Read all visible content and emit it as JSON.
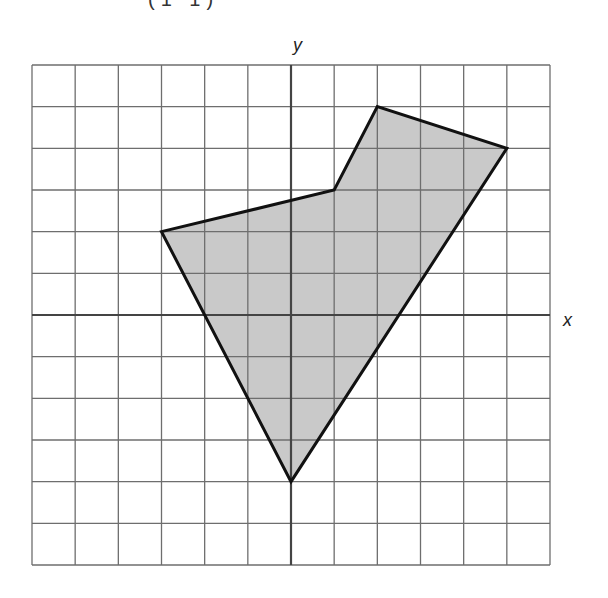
{
  "top_fragment": "(1  1)",
  "axes": {
    "x_label": "x",
    "y_label": "y"
  },
  "grid": {
    "columns": 12,
    "rows": 12,
    "x_min": -6,
    "x_max": 6,
    "y_min": -6,
    "y_max": 6,
    "left_px": 32,
    "top_px": 65,
    "width_px": 518,
    "height_px": 500
  },
  "polygon": {
    "vertices": [
      [
        -3,
        2
      ],
      [
        1,
        3
      ],
      [
        2,
        5
      ],
      [
        5,
        4
      ],
      [
        0,
        -4
      ]
    ],
    "fill": "#c9c9c9",
    "stroke": "#111111"
  },
  "colors": {
    "grid_line": "#6e6e6e",
    "axis_line": "#444444"
  }
}
